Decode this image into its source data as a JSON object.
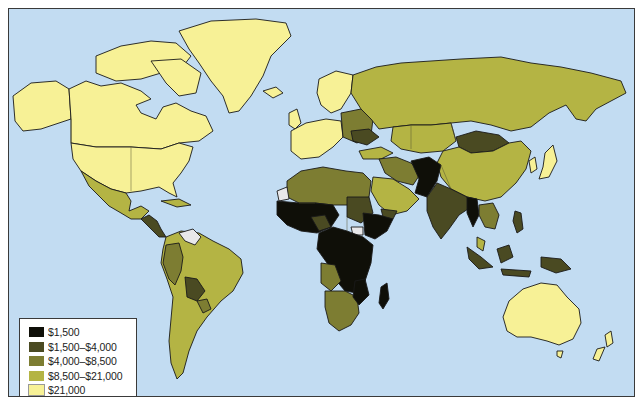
{
  "map": {
    "title": "World GDP per capita",
    "ocean_color": "#c2dcf2",
    "no_data_color": "#e8e8ea",
    "colors": {
      "c1": "#0f0f08",
      "c2": "#4a4a22",
      "c3": "#7d7d32",
      "c4": "#b4b444",
      "c5": "#f7f196"
    }
  },
  "legend": {
    "items": [
      {
        "label": "$1,500",
        "color": "#0f0f08"
      },
      {
        "label": "$1,500–$4,000",
        "color": "#4a4a22"
      },
      {
        "label": "$4,000–$8,500",
        "color": "#7d7d32"
      },
      {
        "label": "$8,500–$21,000",
        "color": "#b4b444"
      },
      {
        "label": "$21,000",
        "color": "#f7f196"
      }
    ]
  }
}
